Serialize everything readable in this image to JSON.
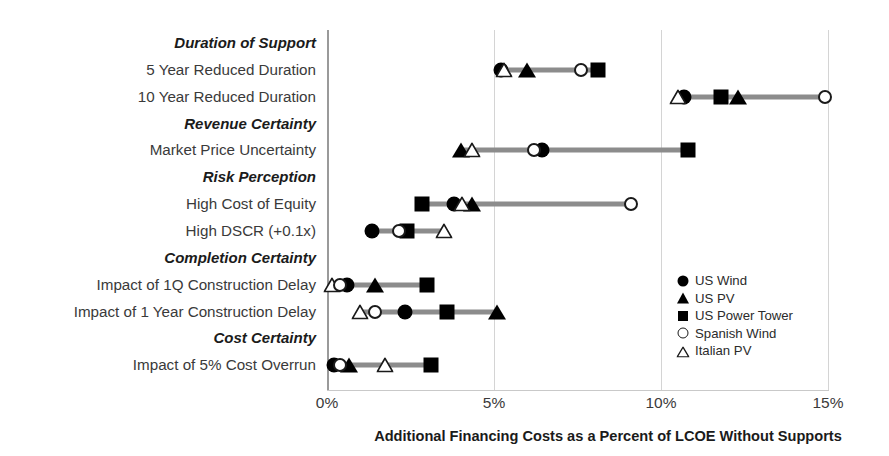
{
  "chart_data": {
    "type": "scatter",
    "title": "",
    "xlabel": "Additional Financing Costs as a Percent of LCOE Without Supports",
    "ylabel": "",
    "xlim": [
      0,
      15
    ],
    "xticks": [
      "0%",
      "5%",
      "10%",
      "15%"
    ],
    "xtick_values": [
      0,
      5,
      10,
      15
    ],
    "grid": "vertical",
    "legend_position": "inside-right",
    "legend": [
      {
        "name": "US Wind",
        "marker": "circle-filled"
      },
      {
        "name": "US PV",
        "marker": "triangle-filled"
      },
      {
        "name": "US Power Tower",
        "marker": "square-filled"
      },
      {
        "name": "Spanish Wind",
        "marker": "circle-open"
      },
      {
        "name": "Italian PV",
        "marker": "triangle-open"
      }
    ],
    "rows": [
      {
        "kind": "category",
        "label": "Duration of Support"
      },
      {
        "kind": "data",
        "label": "5 Year Reduced Duration",
        "points": [
          {
            "series": "US Wind",
            "marker": "circle-filled",
            "value": 5.2
          },
          {
            "series": "Italian PV",
            "marker": "triangle-open",
            "value": 5.3
          },
          {
            "series": "US PV",
            "marker": "triangle-filled",
            "value": 6.0
          },
          {
            "series": "Spanish Wind",
            "marker": "circle-open",
            "value": 7.6
          },
          {
            "series": "US Power Tower",
            "marker": "square-filled",
            "value": 8.1
          }
        ]
      },
      {
        "kind": "data",
        "label": "10 Year Reduced Duration",
        "points": [
          {
            "series": "Italian PV",
            "marker": "triangle-open",
            "value": 10.5
          },
          {
            "series": "US Wind",
            "marker": "circle-filled",
            "value": 10.7
          },
          {
            "series": "US Power Tower",
            "marker": "square-filled",
            "value": 11.8
          },
          {
            "series": "US PV",
            "marker": "triangle-filled",
            "value": 12.3
          },
          {
            "series": "Spanish Wind",
            "marker": "circle-open",
            "value": 14.9
          }
        ]
      },
      {
        "kind": "category",
        "label": "Revenue Certainty"
      },
      {
        "kind": "data",
        "label": "Market Price Uncertainty",
        "points": [
          {
            "series": "US PV",
            "marker": "triangle-filled",
            "value": 4.0
          },
          {
            "series": "Italian PV",
            "marker": "triangle-open",
            "value": 4.35
          },
          {
            "series": "Spanish Wind",
            "marker": "circle-open",
            "value": 6.2
          },
          {
            "series": "US Wind",
            "marker": "circle-filled",
            "value": 6.45
          },
          {
            "series": "US Power Tower",
            "marker": "square-filled",
            "value": 10.8
          }
        ]
      },
      {
        "kind": "category",
        "label": "Risk Perception"
      },
      {
        "kind": "data",
        "label": "High Cost of Equity",
        "points": [
          {
            "series": "US Power Tower",
            "marker": "square-filled",
            "value": 2.85
          },
          {
            "series": "US Wind",
            "marker": "circle-filled",
            "value": 3.8
          },
          {
            "series": "Italian PV",
            "marker": "triangle-open",
            "value": 4.05
          },
          {
            "series": "US PV",
            "marker": "triangle-filled",
            "value": 4.35
          },
          {
            "series": "Spanish Wind",
            "marker": "circle-open",
            "value": 9.1
          }
        ]
      },
      {
        "kind": "data",
        "label": "High DSCR (+0.1x)",
        "points": [
          {
            "series": "US Wind",
            "marker": "circle-filled",
            "value": 1.35
          },
          {
            "series": "Spanish Wind",
            "marker": "circle-open",
            "value": 2.15
          },
          {
            "series": "US Power Tower",
            "marker": "square-filled",
            "value": 2.4
          },
          {
            "series": "Italian PV",
            "marker": "triangle-open",
            "value": 3.5
          }
        ]
      },
      {
        "kind": "category",
        "label": "Completion Certainty"
      },
      {
        "kind": "data",
        "label": "Impact of 1Q Construction  Delay",
        "points": [
          {
            "series": "Italian PV",
            "marker": "triangle-open",
            "value": 0.15
          },
          {
            "series": "Spanish Wind",
            "marker": "circle-open",
            "value": 0.4
          },
          {
            "series": "US Wind",
            "marker": "circle-filled",
            "value": 0.6
          },
          {
            "series": "US PV",
            "marker": "triangle-filled",
            "value": 1.45
          },
          {
            "series": "US Power Tower",
            "marker": "square-filled",
            "value": 3.0
          }
        ]
      },
      {
        "kind": "data",
        "label": "Impact of 1 Year  Construction Delay",
        "points": [
          {
            "series": "Italian PV",
            "marker": "triangle-open",
            "value": 1.0
          },
          {
            "series": "Spanish Wind",
            "marker": "circle-open",
            "value": 1.45
          },
          {
            "series": "US Wind",
            "marker": "circle-filled",
            "value": 2.35
          },
          {
            "series": "US Power Tower",
            "marker": "square-filled",
            "value": 3.6
          },
          {
            "series": "US PV",
            "marker": "triangle-filled",
            "value": 5.1
          }
        ]
      },
      {
        "kind": "category",
        "label": "Cost Certainty"
      },
      {
        "kind": "data",
        "label": "Impact of 5% Cost Overrun",
        "points": [
          {
            "series": "US Wind",
            "marker": "circle-filled",
            "value": 0.2
          },
          {
            "series": "Spanish Wind",
            "marker": "circle-open",
            "value": 0.4
          },
          {
            "series": "US PV",
            "marker": "triangle-filled",
            "value": 0.65
          },
          {
            "series": "Italian PV",
            "marker": "triangle-open",
            "value": 1.75
          },
          {
            "series": "US Power Tower",
            "marker": "square-filled",
            "value": 3.1
          }
        ]
      }
    ],
    "colors": {
      "marker_fill": "#000000",
      "marker_outline": "#1a1a1a",
      "connector": "#8c8c8c",
      "gridline": "#d4d4d4",
      "axis": "#9a9a9a",
      "text": "#231f20"
    }
  }
}
